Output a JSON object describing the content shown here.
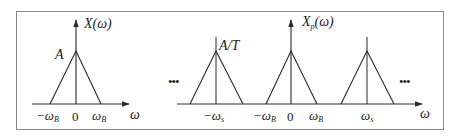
{
  "figure": {
    "frame": {
      "x": 16,
      "y": 11,
      "width": 427,
      "height": 118,
      "stroke": "#8a8a8a"
    },
    "line_color": "#2a2a2a",
    "left_panel": {
      "title": "X(ω)",
      "peak_label": "A",
      "x_axis_label": "ω",
      "ticks": [
        "−ω",
        "0",
        "ω"
      ],
      "tick_subscript": "B",
      "tick_labels_full": [
        "−ω_B",
        "0",
        "ω_B"
      ]
    },
    "right_panel": {
      "title_main": "X",
      "title_sub": "p",
      "title_arg": "(ω)",
      "peak_label": "A/T",
      "x_axis_label": "ω",
      "ellipsis_left": "•••",
      "ellipsis_right": "•••",
      "tick_labels_full": [
        "−ω_s",
        "−ω_B",
        "0",
        "ω_B",
        "ω_s"
      ],
      "ticks": {
        "neg_ws": "−ω",
        "neg_ws_sub": "s",
        "neg_wb": "−ω",
        "neg_wb_sub": "B",
        "zero": "0",
        "wb": "ω",
        "wb_sub": "B",
        "ws": "ω",
        "ws_sub": "s"
      }
    }
  }
}
